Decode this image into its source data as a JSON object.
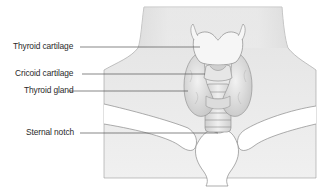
{
  "diagram": {
    "labels": [
      {
        "id": "thyroid-cartilage",
        "text": "Thyroid cartilage"
      },
      {
        "id": "cricoid-cartilage",
        "text": "Cricoid cartilage"
      },
      {
        "id": "thyroid-gland",
        "text": "Thyroid gland"
      },
      {
        "id": "sternal-notch",
        "text": "Sternal notch"
      }
    ],
    "colors": {
      "skin_panel": "#ebebeb",
      "outline": "#8a8a8a",
      "leader_line": "#555555",
      "label_text": "#2a2a2a",
      "cartilage_fill": "#f4f4f4",
      "gland_fill": "#e2e2e2"
    }
  }
}
